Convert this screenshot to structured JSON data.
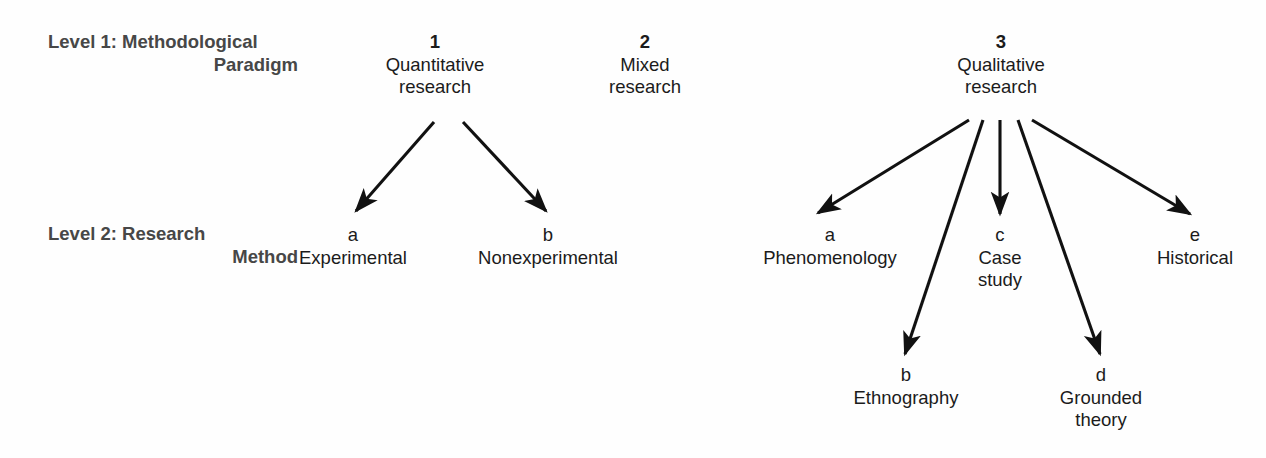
{
  "diagram": {
    "background_color": "#fefefe",
    "line_color": "#111111",
    "text_color": "#1b1b1b",
    "row_label_color": "#474747",
    "rows": [
      {
        "id": "level1",
        "line1": "Level 1: Methodological",
        "line2": "Paradigm"
      },
      {
        "id": "level2",
        "line1": "Level 2: Research",
        "line2": "Method"
      }
    ],
    "level1_nodes": [
      {
        "key": "1",
        "label_line1": "Quantitative",
        "label_line2": "research"
      },
      {
        "key": "2",
        "label_line1": "Mixed",
        "label_line2": "research"
      },
      {
        "key": "3",
        "label_line1": "Qualitative",
        "label_line2": "research"
      }
    ],
    "level2_nodes": [
      {
        "key": "a",
        "label_line1": "Experimental",
        "label_line2": "",
        "parent": "1"
      },
      {
        "key": "b",
        "label_line1": "Nonexperimental",
        "label_line2": "",
        "parent": "1"
      },
      {
        "key": "a",
        "label_line1": "Phenomenology",
        "label_line2": "",
        "parent": "3"
      },
      {
        "key": "b",
        "label_line1": "Ethnography",
        "label_line2": "",
        "parent": "3"
      },
      {
        "key": "c",
        "label_line1": "Case",
        "label_line2": "study",
        "parent": "3"
      },
      {
        "key": "d",
        "label_line1": "Grounded",
        "label_line2": "theory",
        "parent": "3"
      },
      {
        "key": "e",
        "label_line1": "Historical",
        "label_line2": "",
        "parent": "3"
      }
    ],
    "arrows": [
      {
        "from": "1",
        "to": "a-experimental",
        "x1": 434,
        "y1": 122,
        "x2": 356,
        "y2": 211
      },
      {
        "from": "1",
        "to": "b-nonexperimental",
        "x1": 463,
        "y1": 122,
        "x2": 546,
        "y2": 211
      },
      {
        "from": "3",
        "to": "a-phenomenology",
        "x1": 969,
        "y1": 120,
        "x2": 818,
        "y2": 213
      },
      {
        "from": "3",
        "to": "b-ethnography",
        "x1": 983,
        "y1": 120,
        "x2": 905,
        "y2": 354
      },
      {
        "from": "3",
        "to": "c-case-study",
        "x1": 1000,
        "y1": 120,
        "x2": 1000,
        "y2": 214
      },
      {
        "from": "3",
        "to": "d-grounded-theory",
        "x1": 1018,
        "y1": 120,
        "x2": 1100,
        "y2": 354
      },
      {
        "from": "3",
        "to": "e-historical",
        "x1": 1032,
        "y1": 120,
        "x2": 1190,
        "y2": 214
      }
    ]
  }
}
